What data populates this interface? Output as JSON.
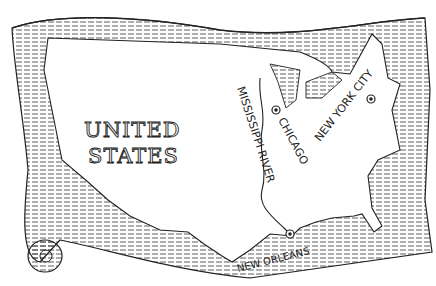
{
  "map": {
    "title_line1": "UNITED",
    "title_line2": "STATES",
    "river": "MISSISSIPPI RIVER",
    "cities": [
      {
        "name": "CHICAGO",
        "x": 276,
        "y": 127
      },
      {
        "name": "NEW YORK CITY",
        "x": 371,
        "y": 99
      },
      {
        "name": "NEW ORLEANS",
        "x": 290,
        "y": 234
      }
    ],
    "ink_color": "#222222",
    "paper_color": "#ffffff"
  }
}
